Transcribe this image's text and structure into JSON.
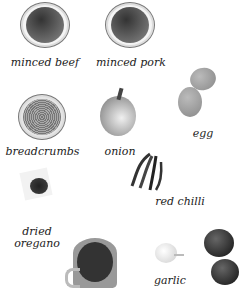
{
  "ingredients": [
    {
      "label": "minced beef",
      "icon": "minced-beef-plate"
    },
    {
      "label": "minced pork",
      "icon": "minced-pork-plate"
    },
    {
      "label": "egg",
      "icon": "eggs"
    },
    {
      "label": "breadcrumbs",
      "icon": "breadcrumbs-bowl"
    },
    {
      "label": "onion",
      "icon": "onion"
    },
    {
      "label": "red chilli",
      "icon": "red-chillies"
    },
    {
      "label": "dried",
      "label2": "oregano",
      "icon": "oregano-pile"
    },
    {
      "label": "",
      "icon": "jug-of-liquid"
    },
    {
      "label": "garlic",
      "icon": "garlic-bulb"
    },
    {
      "label": "",
      "icon": "tomatoes"
    }
  ],
  "colors": {
    "background": "#ffffff",
    "text": "#222222",
    "meat": "#555555",
    "crumbs": "#999999"
  }
}
